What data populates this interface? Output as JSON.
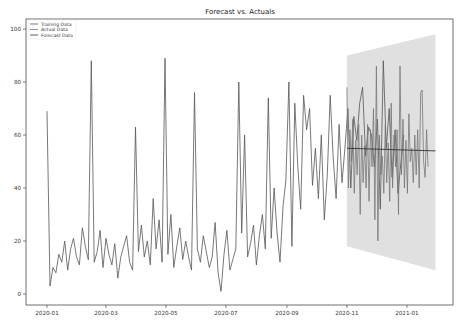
{
  "chart_data": {
    "type": "line",
    "title": "Forecast vs. Actuals",
    "xlabel": "",
    "ylabel": "",
    "ylim": [
      -4,
      104
    ],
    "yticks": [
      0,
      20,
      40,
      60,
      80,
      100
    ],
    "xticks": [
      "2020-01",
      "2020-03",
      "2020-05",
      "2020-07",
      "2020-09",
      "2020-11",
      "2021-01"
    ],
    "xtick_days": [
      0,
      60,
      121,
      182,
      244,
      305,
      366
    ],
    "grid": false,
    "legend_position": "upper left",
    "legend": [
      "Training Data",
      "Actual Data",
      "Forecast Data"
    ],
    "colors": {
      "training": "#555555",
      "actual": "#777777",
      "forecast": "#333333",
      "band": "#e0e0e0"
    },
    "series": [
      {
        "name": "Training Data",
        "x_start_day": 0,
        "x_step_days": 3,
        "values": [
          69,
          3,
          10,
          8,
          15,
          12,
          20,
          9,
          17,
          21,
          14,
          11,
          25,
          18,
          13,
          88,
          12,
          16,
          24,
          10,
          21,
          15,
          11,
          19,
          6,
          14,
          18,
          22,
          12,
          9,
          63,
          16,
          26,
          14,
          20,
          11,
          36,
          17,
          28,
          12,
          89,
          15,
          30,
          10,
          18,
          25,
          13,
          20,
          14,
          9,
          76,
          17,
          12,
          22,
          16,
          10,
          14,
          27,
          8,
          1,
          15,
          24,
          9,
          13,
          17,
          80,
          23,
          60,
          14,
          19,
          26,
          11,
          22,
          30,
          17,
          74,
          21,
          40,
          23,
          12,
          33,
          43,
          80,
          18,
          72,
          48,
          32,
          75,
          62,
          70,
          41,
          55,
          36,
          60,
          28,
          45,
          75,
          52,
          36,
          64,
          42,
          55,
          70,
          40,
          67,
          58,
          72,
          78,
          52,
          63,
          60,
          48,
          66,
          32,
          88,
          55,
          70,
          44,
          62,
          38,
          50,
          60
        ]
      },
      {
        "name": "Actual Data",
        "x_start_day": 305,
        "x_step_days": 1.5,
        "values": [
          78,
          40,
          62,
          50,
          66,
          38,
          58,
          45,
          64,
          30,
          60,
          42,
          56,
          40,
          64,
          35,
          62,
          48,
          70,
          28,
          86,
          20,
          60,
          45,
          52,
          38,
          64,
          42,
          57,
          35,
          72,
          40,
          60,
          48,
          62,
          30,
          86,
          45,
          66,
          40,
          58,
          38,
          68,
          50,
          55,
          42,
          60,
          45,
          62,
          40,
          76,
          77,
          50,
          44,
          62,
          48
        ]
      },
      {
        "name": "Forecast Data",
        "x_start_day": 305,
        "x_end_day": 395,
        "value_start": 55,
        "value_end": 54,
        "confidence_upper": [
          90,
          98
        ],
        "confidence_lower": [
          18,
          9
        ]
      }
    ]
  }
}
